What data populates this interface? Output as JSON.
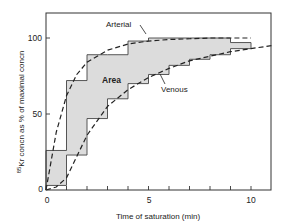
{
  "chart_data": {
    "type": "line",
    "title": "",
    "xlabel": "Time of saturation (min)",
    "ylabel": "85Kr concn as % of maximal concn",
    "ylabel_superscript": "85",
    "ylabel_rest": "Kr concn as % of maximal concn",
    "xlim": [
      0,
      11
    ],
    "ylim": [
      0,
      120
    ],
    "x_ticks": [
      0,
      1,
      2,
      3,
      4,
      5,
      6,
      7,
      8,
      9,
      10
    ],
    "x_tick_labels": [
      "0",
      "",
      "",
      "",
      "",
      "5",
      "",
      "",
      "",
      "",
      "10"
    ],
    "y_ticks": [
      0,
      50,
      100
    ],
    "y_tick_labels": [
      "0",
      "50",
      "100"
    ],
    "grid": false,
    "legend": null,
    "annotations": [
      {
        "text": "Arterial",
        "target": "arterial curve"
      },
      {
        "text": "Venous",
        "target": "venous curve"
      },
      {
        "text": "Area",
        "target": "shaded region between step curves"
      }
    ],
    "series": [
      {
        "name": "Arterial (step)",
        "style": "solid-step",
        "x": [
          0,
          1,
          2,
          3,
          4,
          5,
          6,
          7,
          8,
          9,
          10
        ],
        "values": [
          26,
          72,
          89,
          89,
          98,
          100,
          100,
          100,
          100,
          97,
          97
        ]
      },
      {
        "name": "Venous (step)",
        "style": "solid-step",
        "x": [
          0,
          1,
          2,
          3,
          4,
          5,
          6,
          7,
          8,
          9,
          10
        ],
        "values": [
          3,
          23,
          47,
          60,
          70,
          76,
          82,
          86,
          89,
          93,
          93
        ]
      },
      {
        "name": "Arterial",
        "style": "dashed-curve",
        "x": [
          0,
          0.5,
          1,
          1.5,
          2,
          3,
          4,
          5,
          6,
          7,
          8,
          9,
          10
        ],
        "values": [
          0,
          38,
          62,
          76,
          84,
          92,
          96,
          98,
          99,
          99.5,
          100,
          100,
          100
        ]
      },
      {
        "name": "Venous",
        "style": "dashed-curve",
        "x": [
          0,
          0.5,
          1,
          1.5,
          2,
          3,
          4,
          5,
          6,
          7,
          8,
          9,
          10,
          11
        ],
        "values": [
          0,
          2,
          8,
          22,
          36,
          55,
          66,
          74,
          80,
          85,
          88,
          91,
          93,
          95
        ]
      }
    ],
    "shaded_region": {
      "label": "Area",
      "between": [
        "Arterial (step)",
        "Venous (step)"
      ],
      "color": "#dcdcdc"
    }
  },
  "labels": {
    "arterial": "Arterial",
    "venous": "Venous",
    "area": "Area",
    "xlabel": "Time of saturation (min)",
    "ylabel_sup": "85",
    "ylabel_rest": "Kr concn as % of maximal concn",
    "x0": "0",
    "x5": "5",
    "x10": "10",
    "y0": "0",
    "y50": "50",
    "y100": "100"
  }
}
